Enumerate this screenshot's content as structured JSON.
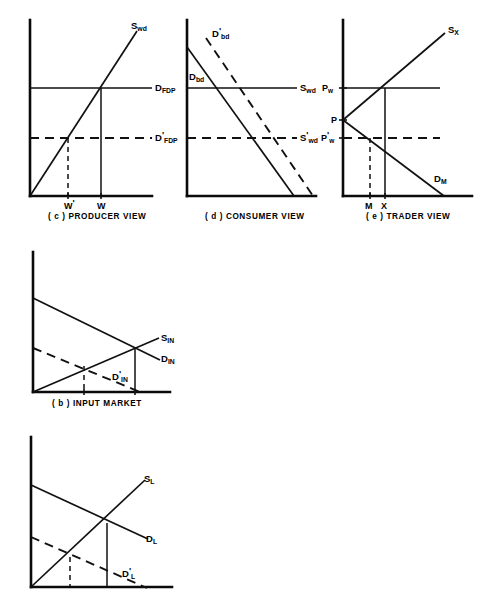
{
  "figure": {
    "background_color": "#ffffff",
    "ink_color": "#111111"
  },
  "panels": [
    {
      "id": "producer-view",
      "caption": "( c ) PRODUCER VIEW",
      "caption_x": 48,
      "caption_y": 219,
      "axes": {
        "origin_x": 30,
        "origin_y": 196,
        "y_top": 20,
        "x_right": 152
      },
      "curves": [
        {
          "name": "supply-wd",
          "label_base": "S",
          "label_sub": "wd",
          "label_prime": "",
          "style": "solid",
          "points": "30,196 137,31",
          "label_x": 131,
          "label_y": 29
        },
        {
          "name": "demand-fdp",
          "label_base": "D",
          "label_sub": "FDP",
          "label_prime": "",
          "style": "solid",
          "points": "30,88 152,88",
          "label_x": 155,
          "label_y": 91
        },
        {
          "name": "demand-fdp-prime",
          "label_base": "D",
          "label_sub": "FDP",
          "label_prime": "'",
          "style": "dashed",
          "points": "30,138 152,138",
          "label_x": 155,
          "label_y": 141
        }
      ],
      "drops": [
        {
          "name": "drop-w-prime",
          "style": "dashed",
          "points": "68,138 68,196"
        },
        {
          "name": "drop-w",
          "style": "solid",
          "points": "101,88 101,196"
        }
      ],
      "x_ticks": [
        {
          "name": "tick-w-prime",
          "x": 68,
          "label_base": "W",
          "label_prime": "'",
          "label_sub": "",
          "label_x": 64,
          "label_y": 209
        },
        {
          "name": "tick-w",
          "x": 101,
          "label_base": "W",
          "label_prime": "",
          "label_sub": "",
          "label_x": 97,
          "label_y": 209
        }
      ],
      "y_ticks": []
    },
    {
      "id": "consumer-view",
      "caption": "( d ) CONSUMER VIEW",
      "caption_x": 205,
      "caption_y": 219,
      "axes": {
        "origin_x": 187,
        "origin_y": 196,
        "y_top": 20,
        "x_right": 316
      },
      "curves": [
        {
          "name": "demand-bd",
          "label_base": "D",
          "label_sub": "bd",
          "label_prime": "",
          "style": "solid",
          "points": "187,47 294,196",
          "label_x": 189,
          "label_y": 80
        },
        {
          "name": "demand-bd-prime",
          "label_base": "D",
          "label_sub": "bd",
          "label_prime": "'",
          "style": "dashed",
          "points": "206,38 313,196",
          "label_x": 212,
          "label_y": 37
        },
        {
          "name": "supply-wd",
          "label_base": "S",
          "label_sub": "wd",
          "label_prime": "",
          "style": "solid",
          "points": "187,88 297,88",
          "label_x": 300,
          "label_y": 91
        },
        {
          "name": "supply-wd-prime",
          "label_base": "S",
          "label_sub": "wd",
          "label_prime": "'",
          "style": "dashed",
          "points": "187,138 297,138",
          "label_x": 300,
          "label_y": 141
        }
      ],
      "drops": [],
      "x_ticks": [],
      "y_ticks": []
    },
    {
      "id": "trader-view",
      "caption": "( e ) TRADER VIEW",
      "caption_x": 366,
      "caption_y": 219,
      "axes": {
        "origin_x": 343,
        "origin_y": 196,
        "y_top": 20,
        "x_right": 472
      },
      "curves": [
        {
          "name": "supply-x",
          "label_base": "S",
          "label_sub": "X",
          "label_prime": "",
          "style": "solid",
          "points": "343,120 445,33",
          "label_x": 448,
          "label_y": 33
        },
        {
          "name": "demand-m",
          "label_base": "D",
          "label_sub": "M",
          "label_prime": "",
          "style": "solid",
          "points": "343,120 444,196",
          "label_x": 434,
          "label_y": 182
        },
        {
          "name": "price-world",
          "label_base": "",
          "label_sub": "",
          "label_prime": "",
          "style": "solid",
          "points": "343,88 440,88",
          "label_x": 0,
          "label_y": 0
        },
        {
          "name": "price-world-prime",
          "label_base": "",
          "label_sub": "",
          "label_prime": "",
          "style": "dashed",
          "points": "343,138 440,138",
          "label_x": 0,
          "label_y": 0
        }
      ],
      "drops": [
        {
          "name": "drop-m",
          "style": "dashed",
          "points": "370,138 370,196"
        },
        {
          "name": "drop-x",
          "style": "solid",
          "points": "385,88 385,196"
        }
      ],
      "x_ticks": [
        {
          "name": "tick-m",
          "x": 370,
          "label_base": "M",
          "label_prime": "",
          "label_sub": "",
          "label_x": 365,
          "label_y": 209
        },
        {
          "name": "tick-x",
          "x": 385,
          "label_base": "X",
          "label_prime": "",
          "label_sub": "",
          "label_x": 381,
          "label_y": 209
        }
      ],
      "y_ticks": [
        {
          "name": "tick-pw",
          "y": 88,
          "label_base": "P",
          "label_sub": "w",
          "label_prime": "",
          "label_x": 322,
          "label_y": 91
        },
        {
          "name": "tick-p",
          "y": 120,
          "label_base": "P",
          "label_sub": "",
          "label_prime": "",
          "label_x": 331,
          "label_y": 123
        },
        {
          "name": "tick-pw-prime",
          "y": 138,
          "label_base": "P",
          "label_sub": "w",
          "label_prime": "'",
          "label_x": 321,
          "label_y": 141
        }
      ]
    },
    {
      "id": "input-market",
      "caption": "( b ) INPUT MARKET",
      "caption_x": 52,
      "caption_y": 406,
      "axes": {
        "origin_x": 33,
        "origin_y": 392,
        "y_top": 252,
        "x_right": 170
      },
      "curves": [
        {
          "name": "supply-in",
          "label_base": "S",
          "label_sub": "IN",
          "label_prime": "",
          "style": "solid",
          "points": "33,392 159,338",
          "label_x": 161,
          "label_y": 341
        },
        {
          "name": "demand-in",
          "label_base": "D",
          "label_sub": "IN",
          "label_prime": "",
          "style": "solid",
          "points": "33,298 160,360",
          "label_x": 161,
          "label_y": 362
        },
        {
          "name": "demand-in-prime",
          "label_base": "D",
          "label_sub": "IN",
          "label_prime": "'",
          "style": "dashed",
          "points": "33,348 140,392",
          "label_x": 112,
          "label_y": 380
        }
      ],
      "drops": [
        {
          "name": "drop-input-prime",
          "style": "dashed",
          "points": "84,366 84,392"
        },
        {
          "name": "drop-input",
          "style": "solid",
          "points": "135,349 135,392"
        }
      ],
      "x_ticks": [
        {
          "name": "tick-input-prime",
          "x": 84,
          "label_base": "",
          "label_prime": "",
          "label_sub": "",
          "label_x": 0,
          "label_y": 0
        },
        {
          "name": "tick-input",
          "x": 135,
          "label_base": "",
          "label_prime": "",
          "label_sub": "",
          "label_x": 0,
          "label_y": 0
        }
      ],
      "y_ticks": []
    },
    {
      "id": "labor-market",
      "caption": "",
      "caption_x": 0,
      "caption_y": 0,
      "axes": {
        "origin_x": 31,
        "origin_y": 587,
        "y_top": 437,
        "x_right": 172
      },
      "curves": [
        {
          "name": "supply-l",
          "label_base": "S",
          "label_sub": "L",
          "label_prime": "",
          "style": "solid",
          "points": "31,587 145,480",
          "label_x": 144,
          "label_y": 482
        },
        {
          "name": "demand-l",
          "label_base": "D",
          "label_sub": "L",
          "label_prime": "",
          "style": "solid",
          "points": "31,485 148,539",
          "label_x": 146,
          "label_y": 542
        },
        {
          "name": "demand-l-prime",
          "label_base": "D",
          "label_sub": "L",
          "label_prime": "'",
          "style": "dashed",
          "points": "31,537 147,588",
          "label_x": 122,
          "label_y": 577
        }
      ],
      "drops": [
        {
          "name": "drop-labor-prime",
          "style": "dashed",
          "points": "70,557 70,587"
        },
        {
          "name": "drop-labor",
          "style": "solid",
          "points": "107,523 107,587"
        }
      ],
      "x_ticks": [],
      "y_ticks": []
    }
  ]
}
